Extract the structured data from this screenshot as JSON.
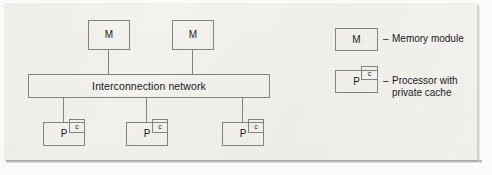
{
  "figure": {
    "kind": "block-diagram"
  },
  "diagram": {
    "memory_modules": [
      {
        "label": "M"
      },
      {
        "label": "M"
      }
    ],
    "network": {
      "label": "Interconnection network"
    },
    "processors": [
      {
        "label": "P",
        "cache_label": "c"
      },
      {
        "label": "P",
        "cache_label": "c"
      },
      {
        "label": "P",
        "cache_label": "c"
      }
    ]
  },
  "legend": {
    "items": [
      {
        "symbol": "M",
        "dash": "–",
        "description": "Memory module"
      },
      {
        "symbol": "P",
        "cache_label": "c",
        "dash": "–",
        "description": "Processor with\nprivate cache"
      }
    ]
  },
  "colors": {
    "paper": "#f4f2ee",
    "line": "#84837f",
    "text": "#1a1a1a"
  }
}
